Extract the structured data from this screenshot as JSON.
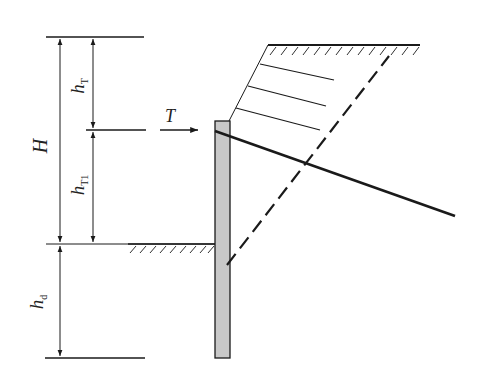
{
  "diagram": {
    "type": "retaining-wall-section",
    "labels": {
      "H": "H",
      "hT_main": "h",
      "hT_sub": "T",
      "hT1_main": "h",
      "hT1_sub": "T1",
      "hd_main": "h",
      "hd_sub": "d",
      "T": "T"
    },
    "colors": {
      "line": "#1a1a1a",
      "wall_fill": "#c8c8c8",
      "background": "#ffffff"
    }
  }
}
